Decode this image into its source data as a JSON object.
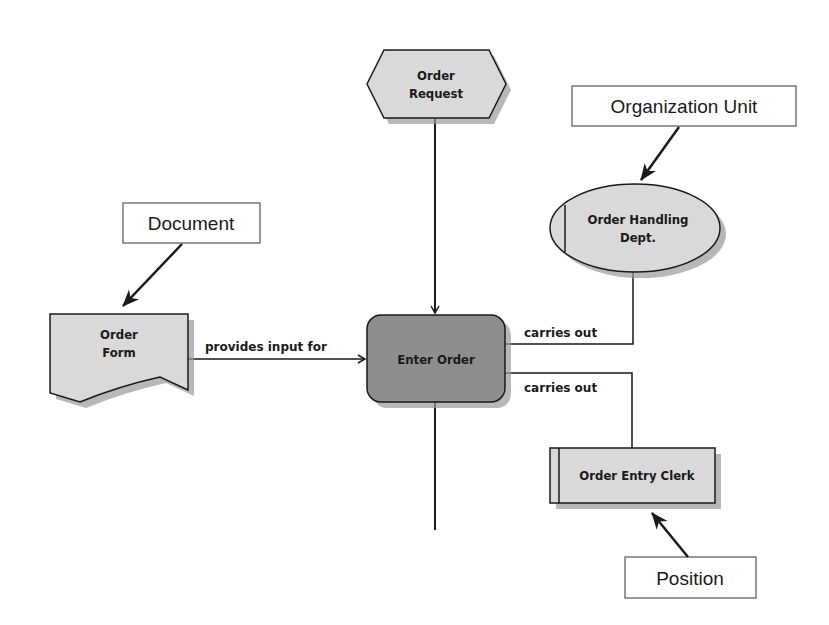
{
  "nodes": {
    "event": {
      "type": "event-hexagon",
      "line1": "Order",
      "line2": "Request",
      "fill": "#d9d9d9"
    },
    "function": {
      "type": "function-rounded-rect",
      "label": "Enter Order",
      "fill": "#8e8e8e"
    },
    "org_unit": {
      "type": "org-unit-ellipse",
      "line1": "Order Handling",
      "line2": "Dept.",
      "fill": "#d9d9d9"
    },
    "document": {
      "type": "document-shape",
      "line1": "Order",
      "line2": "Form",
      "fill": "#d9d9d9"
    },
    "position": {
      "type": "position-rect",
      "label": "Order Entry Clerk",
      "fill": "#d9d9d9"
    }
  },
  "edges": {
    "document_to_function": "provides input for",
    "org_unit_to_function": "carries out",
    "position_to_function": "carries out"
  },
  "callouts": {
    "organization_unit": "Organization Unit",
    "document": "Document",
    "position": "Position"
  },
  "colors": {
    "line": "#1a1a1a",
    "shadow": "#9a9a9a",
    "light_fill": "#d9d9d9",
    "dark_fill": "#8e8e8e"
  }
}
